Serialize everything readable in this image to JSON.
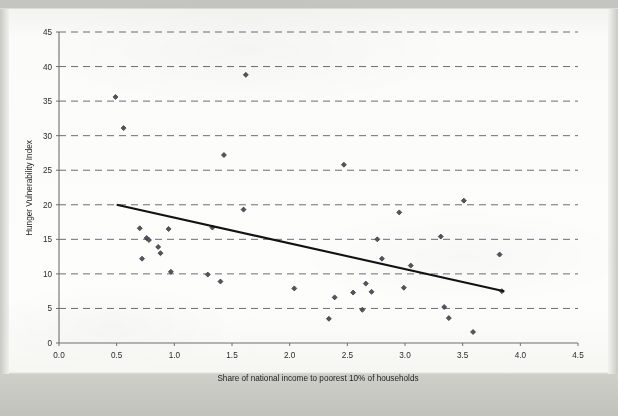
{
  "chart_data": {
    "type": "scatter",
    "title": "",
    "xlabel": "Share of national income to poorest 10% of households",
    "ylabel": "Hunger Vulnerability Index",
    "xlim": [
      0.0,
      4.5
    ],
    "ylim": [
      0,
      45
    ],
    "xticks": [
      "0.0",
      "0.5",
      "1.0",
      "1.5",
      "2.0",
      "2.5",
      "3.0",
      "3.5",
      "4.0",
      "4.5"
    ],
    "xtick_values": [
      0.0,
      0.5,
      1.0,
      1.5,
      2.0,
      2.5,
      3.0,
      3.5,
      4.0,
      4.5
    ],
    "yticks": [
      "0",
      "5",
      "10",
      "15",
      "20",
      "25",
      "30",
      "35",
      "40",
      "45"
    ],
    "ytick_values": [
      0,
      5,
      10,
      15,
      20,
      25,
      30,
      35,
      40,
      45
    ],
    "grid": "horizontal-dashed",
    "legend": "none",
    "marker_color": "#555560",
    "trendline_color": "#121212",
    "points": [
      {
        "x": 0.49,
        "y": 35.6
      },
      {
        "x": 0.56,
        "y": 31.1
      },
      {
        "x": 0.7,
        "y": 16.6
      },
      {
        "x": 0.72,
        "y": 12.2
      },
      {
        "x": 0.76,
        "y": 15.2
      },
      {
        "x": 0.78,
        "y": 14.9
      },
      {
        "x": 0.86,
        "y": 13.9
      },
      {
        "x": 0.88,
        "y": 13.0
      },
      {
        "x": 0.95,
        "y": 16.5
      },
      {
        "x": 0.97,
        "y": 10.3
      },
      {
        "x": 1.29,
        "y": 9.9
      },
      {
        "x": 1.33,
        "y": 16.7
      },
      {
        "x": 1.4,
        "y": 8.9
      },
      {
        "x": 1.43,
        "y": 27.2
      },
      {
        "x": 1.6,
        "y": 19.3
      },
      {
        "x": 1.62,
        "y": 38.8
      },
      {
        "x": 2.04,
        "y": 7.9
      },
      {
        "x": 2.34,
        "y": 3.5
      },
      {
        "x": 2.39,
        "y": 6.6
      },
      {
        "x": 2.47,
        "y": 25.8
      },
      {
        "x": 2.55,
        "y": 7.3
      },
      {
        "x": 2.63,
        "y": 4.8
      },
      {
        "x": 2.66,
        "y": 8.6
      },
      {
        "x": 2.71,
        "y": 7.4
      },
      {
        "x": 2.76,
        "y": 15.0
      },
      {
        "x": 2.8,
        "y": 12.2
      },
      {
        "x": 2.95,
        "y": 18.9
      },
      {
        "x": 2.99,
        "y": 8.0
      },
      {
        "x": 3.05,
        "y": 11.2
      },
      {
        "x": 3.31,
        "y": 15.4
      },
      {
        "x": 3.34,
        "y": 5.2
      },
      {
        "x": 3.38,
        "y": 3.6
      },
      {
        "x": 3.51,
        "y": 20.6
      },
      {
        "x": 3.59,
        "y": 1.6
      },
      {
        "x": 3.82,
        "y": 12.8
      },
      {
        "x": 3.84,
        "y": 7.5
      }
    ],
    "trendline": {
      "x0": 0.5,
      "y0": 20.0,
      "x1": 3.86,
      "y1": 7.5
    }
  }
}
